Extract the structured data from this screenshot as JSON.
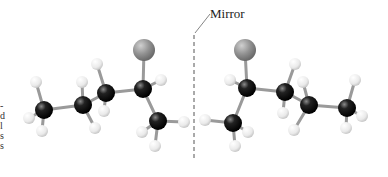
{
  "figure": {
    "mirror_label": "Mirror",
    "edge_fragments": [
      "-",
      "d",
      "l",
      "s",
      "s"
    ],
    "colors": {
      "carbon": "#111111",
      "hydrogen": "#eeeeee",
      "halogen": "#8e8e8e",
      "bond": "#9a9a9a",
      "mirror_line": "#555555"
    }
  },
  "molecules": [
    {
      "name": "left-enantiomer",
      "atoms": [
        {
          "id": "X",
          "type": "halogen",
          "x": 144,
          "y": 50,
          "r": 11
        },
        {
          "id": "Ca",
          "type": "carbon",
          "x": 143,
          "y": 89,
          "r": 9
        },
        {
          "id": "Cb",
          "type": "carbon",
          "x": 106,
          "y": 93,
          "r": 9
        },
        {
          "id": "Cc",
          "type": "carbon",
          "x": 83,
          "y": 105,
          "r": 9
        },
        {
          "id": "Cd",
          "type": "carbon",
          "x": 44,
          "y": 110,
          "r": 9
        },
        {
          "id": "Ce",
          "type": "carbon",
          "x": 158,
          "y": 121,
          "r": 9
        },
        {
          "id": "H1",
          "type": "hydrogen",
          "x": 161,
          "y": 80,
          "r": 6
        },
        {
          "id": "H2",
          "type": "hydrogen",
          "x": 97,
          "y": 64,
          "r": 6
        },
        {
          "id": "H3",
          "type": "hydrogen",
          "x": 104,
          "y": 111,
          "r": 6
        },
        {
          "id": "H4",
          "type": "hydrogen",
          "x": 82,
          "y": 82,
          "r": 6
        },
        {
          "id": "H5",
          "type": "hydrogen",
          "x": 95,
          "y": 128,
          "r": 6
        },
        {
          "id": "H6",
          "type": "hydrogen",
          "x": 36,
          "y": 82,
          "r": 6
        },
        {
          "id": "H7",
          "type": "hydrogen",
          "x": 29,
          "y": 118,
          "r": 6
        },
        {
          "id": "H8",
          "type": "hydrogen",
          "x": 42,
          "y": 131,
          "r": 6
        },
        {
          "id": "H9",
          "type": "hydrogen",
          "x": 184,
          "y": 122,
          "r": 6
        },
        {
          "id": "H10",
          "type": "hydrogen",
          "x": 142,
          "y": 132,
          "r": 6
        },
        {
          "id": "H11",
          "type": "hydrogen",
          "x": 155,
          "y": 146,
          "r": 6
        }
      ],
      "bonds": [
        [
          "X",
          "Ca"
        ],
        [
          "Ca",
          "Cb"
        ],
        [
          "Cb",
          "Cc"
        ],
        [
          "Cc",
          "Cd"
        ],
        [
          "Ca",
          "Ce"
        ],
        [
          "Ca",
          "H1"
        ],
        [
          "Cb",
          "H2"
        ],
        [
          "Cb",
          "H3"
        ],
        [
          "Cc",
          "H4"
        ],
        [
          "Cc",
          "H5"
        ],
        [
          "Cd",
          "H6"
        ],
        [
          "Cd",
          "H7"
        ],
        [
          "Cd",
          "H8"
        ],
        [
          "Ce",
          "H9"
        ],
        [
          "Ce",
          "H10"
        ],
        [
          "Ce",
          "H11"
        ]
      ]
    },
    {
      "name": "right-enantiomer",
      "atoms": [
        {
          "id": "X",
          "type": "halogen",
          "x": 245,
          "y": 50,
          "r": 11
        },
        {
          "id": "Ca",
          "type": "carbon",
          "x": 247,
          "y": 88,
          "r": 9
        },
        {
          "id": "Cb",
          "type": "carbon",
          "x": 285,
          "y": 92,
          "r": 9
        },
        {
          "id": "Cc",
          "type": "carbon",
          "x": 309,
          "y": 105,
          "r": 9
        },
        {
          "id": "Cd",
          "type": "carbon",
          "x": 347,
          "y": 108,
          "r": 9
        },
        {
          "id": "Ce",
          "type": "carbon",
          "x": 233,
          "y": 123,
          "r": 9
        },
        {
          "id": "H1",
          "type": "hydrogen",
          "x": 230,
          "y": 80,
          "r": 6
        },
        {
          "id": "H2",
          "type": "hydrogen",
          "x": 295,
          "y": 64,
          "r": 6
        },
        {
          "id": "H3",
          "type": "hydrogen",
          "x": 283,
          "y": 113,
          "r": 6
        },
        {
          "id": "H4",
          "type": "hydrogen",
          "x": 303,
          "y": 82,
          "r": 6
        },
        {
          "id": "H5",
          "type": "hydrogen",
          "x": 294,
          "y": 130,
          "r": 6
        },
        {
          "id": "H6",
          "type": "hydrogen",
          "x": 355,
          "y": 80,
          "r": 6
        },
        {
          "id": "H7",
          "type": "hydrogen",
          "x": 362,
          "y": 116,
          "r": 6
        },
        {
          "id": "H8",
          "type": "hydrogen",
          "x": 346,
          "y": 128,
          "r": 6
        },
        {
          "id": "H9",
          "type": "hydrogen",
          "x": 205,
          "y": 120,
          "r": 6
        },
        {
          "id": "H10",
          "type": "hydrogen",
          "x": 248,
          "y": 132,
          "r": 6
        },
        {
          "id": "H11",
          "type": "hydrogen",
          "x": 235,
          "y": 146,
          "r": 6
        }
      ],
      "bonds": [
        [
          "X",
          "Ca"
        ],
        [
          "Ca",
          "Cb"
        ],
        [
          "Cb",
          "Cc"
        ],
        [
          "Cc",
          "Cd"
        ],
        [
          "Ca",
          "Ce"
        ],
        [
          "Ca",
          "H1"
        ],
        [
          "Cb",
          "H2"
        ],
        [
          "Cb",
          "H3"
        ],
        [
          "Cc",
          "H4"
        ],
        [
          "Cc",
          "H5"
        ],
        [
          "Cd",
          "H6"
        ],
        [
          "Cd",
          "H7"
        ],
        [
          "Cd",
          "H8"
        ],
        [
          "Ce",
          "H9"
        ],
        [
          "Ce",
          "H10"
        ],
        [
          "Ce",
          "H11"
        ]
      ]
    }
  ]
}
